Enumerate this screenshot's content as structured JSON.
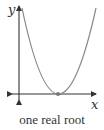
{
  "diagram": {
    "title": "one real root",
    "axes": {
      "x_label": "x",
      "y_label": "y"
    },
    "curve": {
      "type": "parabola",
      "opens": "up",
      "color": "#888888",
      "vertex_on_x_axis": true
    },
    "root_marker": {
      "count": 1,
      "color": "#777777"
    },
    "axis_color": "#333333"
  }
}
